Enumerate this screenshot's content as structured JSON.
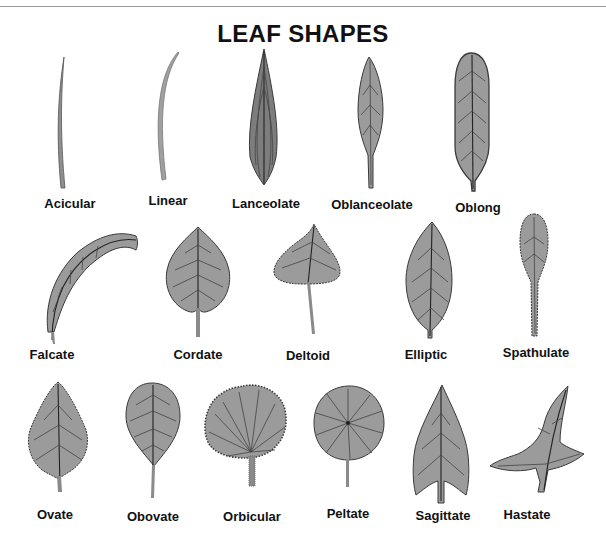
{
  "title": "LEAF SHAPES",
  "colors": {
    "leaf_fill": "#9b9b9b",
    "leaf_outline": "#3a3a3a",
    "text": "#111111",
    "background": "#ffffff"
  },
  "leaves": [
    {
      "name": "Acicular"
    },
    {
      "name": "Linear"
    },
    {
      "name": "Lanceolate"
    },
    {
      "name": "Oblanceolate"
    },
    {
      "name": "Oblong"
    },
    {
      "name": "Falcate"
    },
    {
      "name": "Cordate"
    },
    {
      "name": "Deltoid"
    },
    {
      "name": "Elliptic"
    },
    {
      "name": "Spathulate"
    },
    {
      "name": "Ovate"
    },
    {
      "name": "Obovate"
    },
    {
      "name": "Orbicular"
    },
    {
      "name": "Peltate"
    },
    {
      "name": "Sagittate"
    },
    {
      "name": "Hastate"
    }
  ]
}
